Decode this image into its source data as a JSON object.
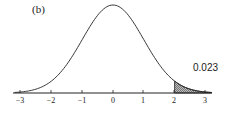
{
  "panel_label": "(b)",
  "annotation": "0.023",
  "chart_data": {
    "type": "area",
    "title": "",
    "subtitle": "(b)",
    "x_ticks": [
      "-3",
      "-2",
      "-1",
      "0",
      "1",
      "2",
      "3"
    ],
    "xlim": [
      -3.2,
      3.2
    ],
    "xlabel": "",
    "ylabel": "",
    "grid": false,
    "shaded_region": {
      "from": 2,
      "to": 3.2,
      "area": 0.023
    },
    "annotations": [
      {
        "text": "0.023",
        "x": 2.8,
        "y": "above tail"
      }
    ]
  },
  "ticks": [
    {
      "label": "−3",
      "x": 20
    },
    {
      "label": "−2",
      "x": 51
    },
    {
      "label": "−1",
      "x": 82
    },
    {
      "label": "0",
      "x": 113
    },
    {
      "label": "1",
      "x": 143
    },
    {
      "label": "2",
      "x": 174
    },
    {
      "label": "3",
      "x": 205
    }
  ]
}
